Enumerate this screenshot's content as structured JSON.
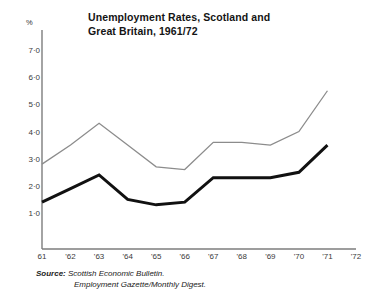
{
  "figure": {
    "title_line1": "Unemployment Rates, Scotland and",
    "title_line2": "Great Britain, 1961/72",
    "y_axis_unit": "%",
    "source_label": "Source:",
    "source_line1": "Scottish Economic Bulletin.",
    "source_line2": "Employment Gazette/Monthly Digest."
  },
  "chart_data": {
    "type": "line",
    "title": "Unemployment Rates, Scotland and Great Britain, 1961/72",
    "xlabel": "",
    "ylabel": "%",
    "x": [
      "61",
      "62",
      "63",
      "64",
      "65",
      "66",
      "67",
      "68",
      "69",
      "70",
      "71",
      "72"
    ],
    "xtick_labels": [
      "61",
      "'62",
      "'63",
      "'64",
      "'65",
      "'66",
      "'67",
      "'68",
      "'69",
      "'70",
      "'71",
      "'72"
    ],
    "ytick_labels": [
      "1·0",
      "2·0",
      "3·0",
      "4·0",
      "5·0",
      "6·0",
      "7·0"
    ],
    "ytick_values": [
      1.0,
      2.0,
      3.0,
      4.0,
      5.0,
      6.0,
      7.0
    ],
    "ylim": [
      0,
      7.6
    ],
    "xlim": [
      "61",
      "72"
    ],
    "grid": false,
    "legend": "none",
    "series": [
      {
        "name": "Scotland",
        "color": "#8c8c8c",
        "linewidth": 1.3,
        "x": [
          "61",
          "62",
          "63",
          "64",
          "65",
          "66",
          "67",
          "68",
          "69",
          "70",
          "71"
        ],
        "values": [
          2.8,
          3.5,
          4.3,
          3.5,
          2.7,
          2.6,
          3.6,
          3.6,
          3.5,
          4.0,
          5.5
        ]
      },
      {
        "name": "Great Britain",
        "color": "#111111",
        "linewidth": 3.0,
        "x": [
          "61",
          "62",
          "63",
          "64",
          "65",
          "66",
          "67",
          "68",
          "69",
          "70",
          "71"
        ],
        "values": [
          1.4,
          1.9,
          2.4,
          1.5,
          1.3,
          1.4,
          2.3,
          2.3,
          2.3,
          2.5,
          3.5
        ]
      }
    ]
  }
}
